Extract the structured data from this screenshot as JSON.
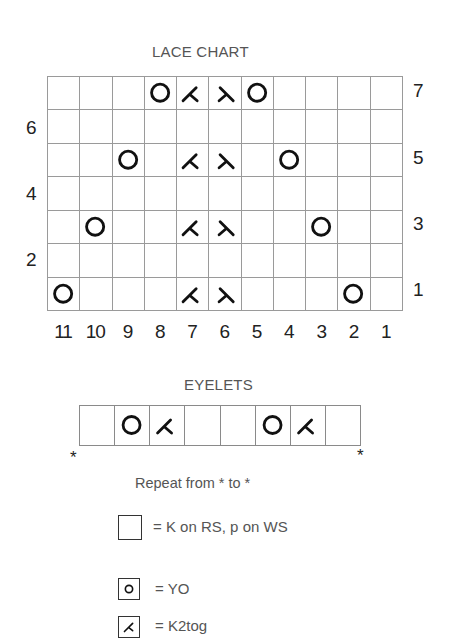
{
  "lace_chart": {
    "title": "LACE CHART",
    "columns": 11,
    "rows": 7,
    "right_row_labels": [
      "7",
      "5",
      "3",
      "1"
    ],
    "left_row_labels": [
      "6",
      "4",
      "2"
    ],
    "column_labels": [
      "11",
      "10",
      "9",
      "8",
      "7",
      "6",
      "5",
      "4",
      "3",
      "2",
      "1"
    ],
    "grid_rows_top_to_bottom": [
      {
        "row": 7,
        "cells": [
          "",
          "",
          "",
          "yo",
          "k2tog",
          "ssk",
          "yo",
          "",
          "",
          "",
          ""
        ]
      },
      {
        "row": 6,
        "cells": [
          "",
          "",
          "",
          "",
          "",
          "",
          "",
          "",
          "",
          "",
          ""
        ]
      },
      {
        "row": 5,
        "cells": [
          "",
          "",
          "yo",
          "",
          "k2tog",
          "ssk",
          "",
          "yo",
          "",
          "",
          ""
        ]
      },
      {
        "row": 4,
        "cells": [
          "",
          "",
          "",
          "",
          "",
          "",
          "",
          "",
          "",
          "",
          ""
        ]
      },
      {
        "row": 3,
        "cells": [
          "",
          "yo",
          "",
          "",
          "k2tog",
          "ssk",
          "",
          "",
          "yo",
          "",
          ""
        ]
      },
      {
        "row": 2,
        "cells": [
          "",
          "",
          "",
          "",
          "",
          "",
          "",
          "",
          "",
          "",
          ""
        ]
      },
      {
        "row": 1,
        "cells": [
          "yo",
          "",
          "",
          "",
          "k2tog",
          "ssk",
          "",
          "",
          "",
          "yo",
          ""
        ]
      }
    ]
  },
  "eyelets": {
    "title": "EYELETS",
    "cells": [
      "",
      "yo",
      "k2tog",
      "",
      "",
      "yo",
      "k2tog",
      ""
    ],
    "repeat_marker_left": "*",
    "repeat_marker_right": "*",
    "repeat_note": "Repeat from * to *"
  },
  "legend": [
    {
      "symbol": "blank",
      "icon": "empty-square-icon",
      "text": "= K on RS, p on WS"
    },
    {
      "symbol": "yo",
      "icon": "circle-icon",
      "text": "= YO"
    },
    {
      "symbol": "k2tog",
      "icon": "k2tog-icon",
      "text": "= K2tog"
    }
  ],
  "colors": {
    "symbol": "#111111",
    "grid_line": "#9a9a9a",
    "label_text": "#555555"
  }
}
